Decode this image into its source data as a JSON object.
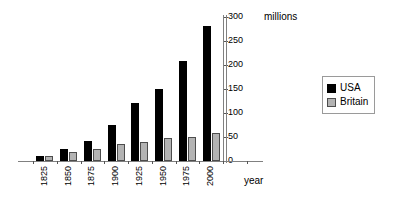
{
  "chart_data": {
    "type": "bar",
    "title": "",
    "subtitle": "",
    "xlabel": "year",
    "ylabel": "millions",
    "categories": [
      "1825",
      "1850",
      "1875",
      "1900",
      "1925",
      "1950",
      "1975",
      "2000"
    ],
    "series": [
      {
        "name": "USA",
        "color": "#000000",
        "values": [
          11,
          25,
          42,
          76,
          120,
          150,
          208,
          281
        ]
      },
      {
        "name": "Britain",
        "color": "#b3b3b3",
        "values": [
          10,
          18,
          25,
          35,
          40,
          48,
          51,
          58
        ]
      }
    ],
    "ylim": [
      0,
      300
    ],
    "ytick_step": 50,
    "yticks": [
      "0",
      "50",
      "100",
      "150",
      "200",
      "250",
      "300"
    ],
    "grid": true,
    "y_axis_position": "right",
    "legend_position": "right",
    "legend_entries": [
      "USA",
      "Britain"
    ]
  },
  "axes": {
    "y_unit_label": "millions",
    "x_title": "year"
  },
  "legend": {
    "items": [
      {
        "label": "USA",
        "swatch": "black-square-icon"
      },
      {
        "label": "Britain",
        "swatch": "gray-square-icon"
      }
    ]
  }
}
